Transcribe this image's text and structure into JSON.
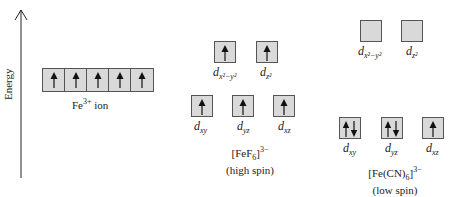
{
  "axis": {
    "label": "Energy"
  },
  "free_ion": {
    "caption": "Fe",
    "caption_sup": "3+",
    "caption_rest": " ion",
    "orbitals": [
      "up",
      "up",
      "up",
      "up",
      "up"
    ]
  },
  "high_spin": {
    "title": "[FeF",
    "title_sub": "6",
    "title_sup": "]3−",
    "subtitle": "(high spin)",
    "eg": [
      {
        "label_main": "d",
        "label_sub": "x²−y²",
        "electrons": "up"
      },
      {
        "label_main": "d",
        "label_sub": "z²",
        "electrons": "up"
      }
    ],
    "t2g": [
      {
        "label_main": "d",
        "label_sub": "xy",
        "electrons": "up"
      },
      {
        "label_main": "d",
        "label_sub": "yz",
        "electrons": "up"
      },
      {
        "label_main": "d",
        "label_sub": "xz",
        "electrons": "up"
      }
    ]
  },
  "low_spin": {
    "title": "[Fe(CN)",
    "title_sub": "6",
    "title_sup": "]3−",
    "subtitle": "(low spin)",
    "eg": [
      {
        "label_main": "d",
        "label_sub": "x²−y²",
        "electrons": "empty"
      },
      {
        "label_main": "d",
        "label_sub": "z²",
        "electrons": "empty"
      }
    ],
    "t2g": [
      {
        "label_main": "d",
        "label_sub": "xy",
        "electrons": "pair"
      },
      {
        "label_main": "d",
        "label_sub": "yz",
        "electrons": "pair"
      },
      {
        "label_main": "d",
        "label_sub": "xz",
        "electrons": "up"
      }
    ]
  },
  "colors": {
    "box_fill": "#d9d9d9",
    "box_border": "#555555",
    "arrow": "#111111"
  }
}
